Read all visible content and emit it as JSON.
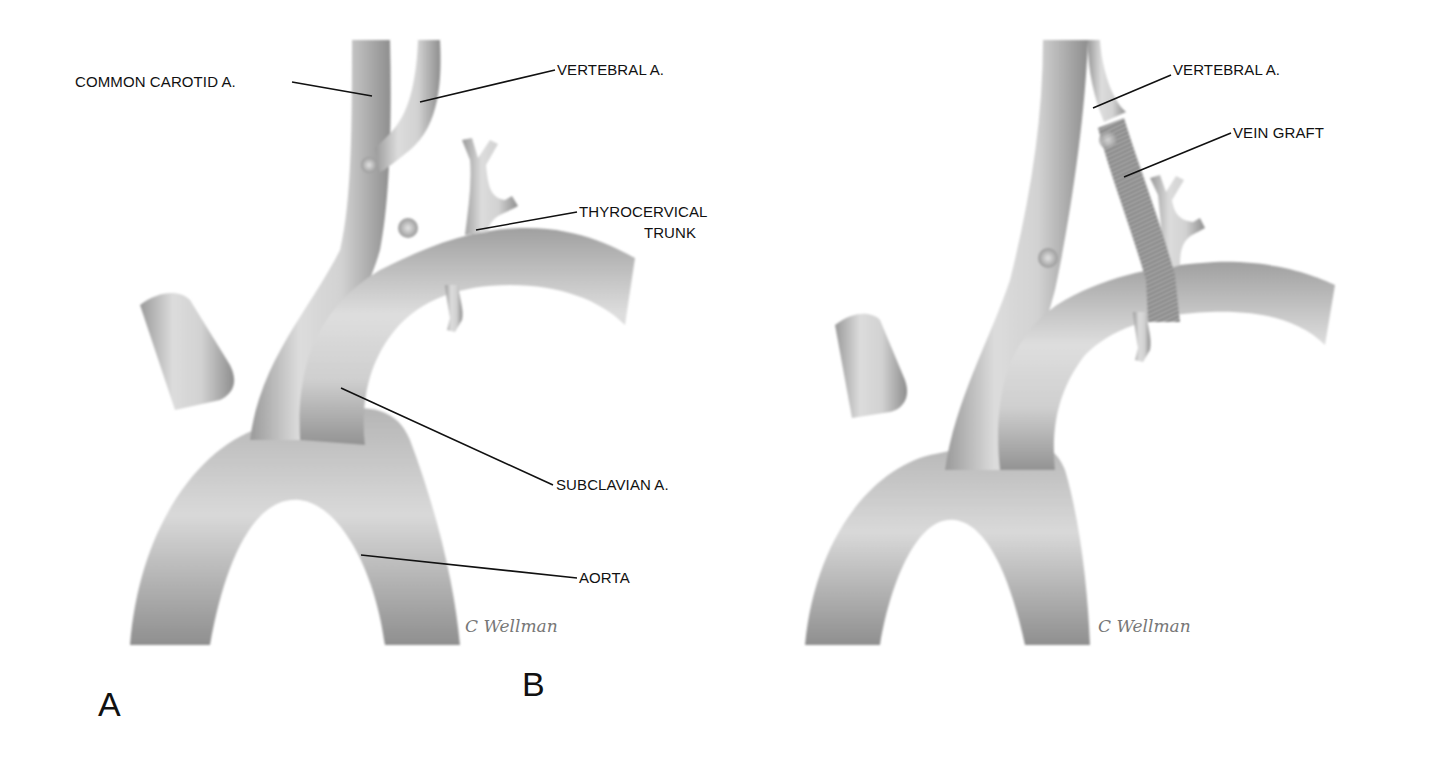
{
  "figure": {
    "panels": [
      {
        "letter": "A",
        "labels": {
          "common_carotid": "COMMON CAROTID A.",
          "vertebral": "VERTEBRAL A.",
          "thyrocervical_line1": "THYROCERVICAL",
          "thyrocervical_line2": "TRUNK",
          "subclavian": "SUBCLAVIAN A.",
          "aorta": "AORTA"
        },
        "signature": "C Wellman"
      },
      {
        "letter": "B",
        "labels": {
          "vertebral": "VERTEBRAL A.",
          "vein_graft": "VEIN GRAFT"
        },
        "signature": "C Wellman"
      }
    ],
    "colors": {
      "background": "#ffffff",
      "vessel_light": "#e6e6e6",
      "vessel_mid": "#b9b9b9",
      "vessel_dark": "#8a8a8a",
      "text": "#111111"
    }
  }
}
